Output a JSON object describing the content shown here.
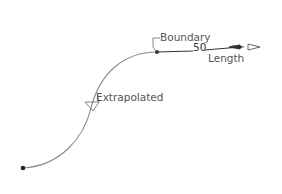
{
  "diagram": {
    "labels": {
      "boundary": "Boundary",
      "extrapolated": "Extrapolated",
      "length_value": "50",
      "length": "Length"
    },
    "colors": {
      "curve": "#8a8a8a",
      "extension": "#333333",
      "text": "#555555",
      "point": "#222222"
    }
  }
}
